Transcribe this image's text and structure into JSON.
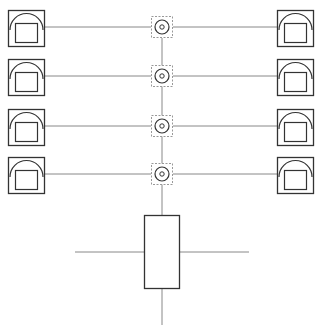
{
  "diagram": {
    "title": "",
    "colors": {
      "stroke": "#333333",
      "line": "#888888",
      "dashed": "#999999",
      "background": "#ffffff"
    },
    "rows": [
      {
        "y": 27,
        "left_device": "device-box",
        "hub": "coax-node",
        "right_device": "device-box"
      },
      {
        "y": 76,
        "left_device": "device-box",
        "hub": "coax-node",
        "right_device": "device-box"
      },
      {
        "y": 126,
        "left_device": "device-box",
        "hub": "coax-node",
        "right_device": "device-box"
      },
      {
        "y": 174,
        "left_device": "device-box",
        "hub": "coax-node",
        "right_device": "device-box"
      }
    ],
    "central_unit": {
      "label": ""
    }
  }
}
